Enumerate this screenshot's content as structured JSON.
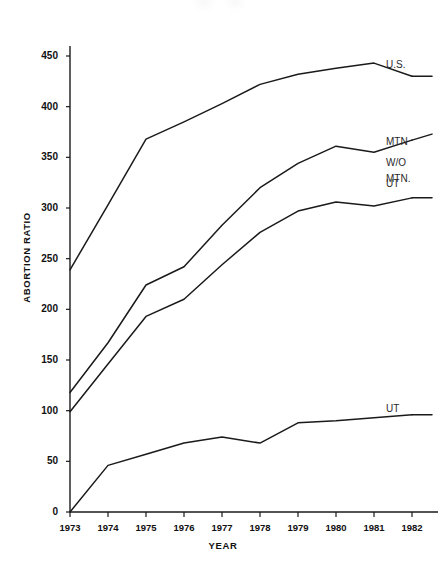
{
  "chart_data": {
    "type": "line",
    "title": "",
    "xlabel": "YEAR",
    "ylabel": "ABORTION RATIO",
    "x": [
      1973,
      1974,
      1975,
      1976,
      1977,
      1978,
      1979,
      1980,
      1981,
      1982
    ],
    "categories": [
      "1973",
      "1974",
      "1975",
      "1976",
      "1977",
      "1978",
      "1979",
      "1980",
      "1981",
      "1982"
    ],
    "xlim": [
      1973,
      1982
    ],
    "ylim": [
      0,
      450
    ],
    "yticks": [
      0,
      50,
      100,
      150,
      200,
      250,
      300,
      350,
      400,
      450
    ],
    "ytick_labels": [
      "0",
      "50",
      "100",
      "150",
      "200",
      "250",
      "300",
      "350",
      "400",
      "450"
    ],
    "grid": false,
    "legend_position": "right-inline",
    "series": [
      {
        "name": "U.S.",
        "label": "U.S.",
        "color": "#1a1a1a",
        "values": [
          239,
          303,
          368,
          385,
          403,
          422,
          432,
          438,
          443,
          430
        ]
      },
      {
        "name": "MTN W/O UT",
        "label": "MTN\nW/O\nUT",
        "color": "#1a1a1a",
        "values": [
          118,
          167,
          224,
          242,
          283,
          320,
          344,
          361,
          355,
          367
        ]
      },
      {
        "name": "MTN.",
        "label": "MTN.",
        "color": "#1a1a1a",
        "values": [
          99,
          146,
          193,
          210,
          244,
          276,
          297,
          306,
          302,
          310
        ]
      },
      {
        "name": "UT",
        "label": "UT",
        "color": "#1a1a1a",
        "values": [
          0,
          46,
          57,
          68,
          74,
          68,
          88,
          90,
          93,
          96
        ]
      }
    ]
  },
  "axes": {
    "y_title": "ABORTION RATIO",
    "x_title": "YEAR"
  },
  "series_labels": {
    "us": "U.S.",
    "mtn_wo_ut_line1": "MTN",
    "mtn_wo_ut_line2": "W/O",
    "mtn_wo_ut_line3": "UT",
    "mtn": "MTN.",
    "ut": "UT"
  }
}
